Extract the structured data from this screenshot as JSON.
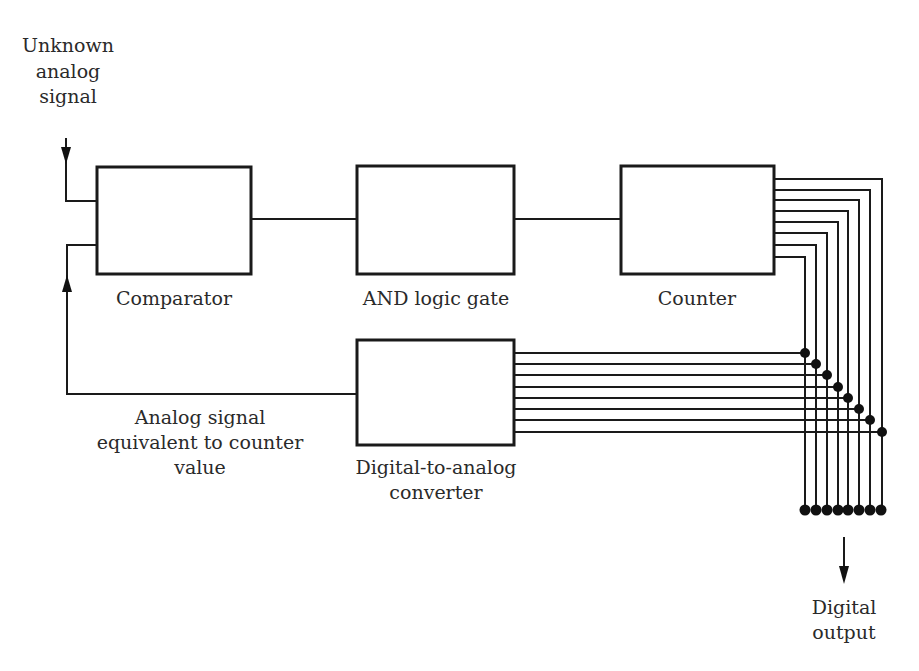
{
  "diagram": {
    "title_input_label": [
      "Unknown",
      "analog",
      "signal"
    ],
    "blocks": {
      "comparator": {
        "label": "Comparator"
      },
      "and_gate": {
        "label": "AND logic gate"
      },
      "counter": {
        "label": "Counter"
      },
      "dac": {
        "label_lines": [
          "Digital-to-analog",
          "converter"
        ]
      }
    },
    "feedback_label": [
      "Analog signal",
      "equivalent to counter",
      "value"
    ],
    "output_label": [
      "Digital",
      "output"
    ],
    "bit_count": 8,
    "colors": {
      "line": "#1a1a1a",
      "text": "#2a2a2a",
      "background": "#ffffff"
    }
  }
}
